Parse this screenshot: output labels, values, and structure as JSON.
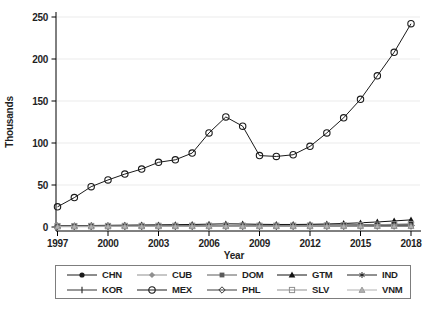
{
  "chart_data": {
    "type": "line",
    "title": "",
    "xlabel": "Year",
    "ylabel": "Thousands",
    "units": "Thousands",
    "x": [
      1997,
      1998,
      1999,
      2000,
      2001,
      2002,
      2003,
      2004,
      2005,
      2006,
      2007,
      2008,
      2009,
      2010,
      2011,
      2012,
      2013,
      2014,
      2015,
      2016,
      2017,
      2018
    ],
    "xticks": [
      1997,
      2000,
      2003,
      2006,
      2009,
      2012,
      2015,
      2018
    ],
    "yticks": [
      0,
      50,
      100,
      150,
      200,
      250
    ],
    "ylim": [
      0,
      250
    ],
    "xlim": [
      1997,
      2018
    ],
    "grid": "horizontal",
    "gridline_color": "#ebebeb",
    "axis_color": "#000000",
    "legend_position": "bottom",
    "legend_columns": 5,
    "series": [
      {
        "name": "CHN",
        "marker": "circle_f",
        "color": "#1a1a1a",
        "values": [
          1.2,
          1.3,
          1.3,
          1.4,
          1.5,
          1.5,
          1.6,
          1.6,
          1.7,
          1.8,
          1.8,
          1.9,
          2.0,
          2.0,
          2.1,
          2.2,
          2.3,
          2.4,
          2.6,
          2.8,
          3.0,
          3.2
        ]
      },
      {
        "name": "CUB",
        "marker": "diamond_f",
        "color": "#8f8f8f",
        "values": [
          0.9,
          0.9,
          0.9,
          1.0,
          1.0,
          1.0,
          1.0,
          1.1,
          1.1,
          1.1,
          1.1,
          1.1,
          1.0,
          1.0,
          1.1,
          1.1,
          1.2,
          1.2,
          1.3,
          1.3,
          1.4,
          1.5
        ]
      },
      {
        "name": "DOM",
        "marker": "square_f",
        "color": "#5a5a5a",
        "values": [
          0.7,
          0.7,
          0.7,
          0.8,
          0.8,
          0.8,
          0.8,
          0.8,
          0.9,
          0.9,
          0.9,
          0.9,
          0.8,
          0.8,
          0.9,
          0.9,
          0.9,
          1.0,
          1.0,
          1.1,
          1.1,
          1.2
        ]
      },
      {
        "name": "GTM",
        "marker": "triangle_f",
        "color": "#111111",
        "values": [
          1.5,
          1.6,
          1.8,
          2.0,
          2.2,
          2.4,
          2.6,
          2.8,
          3.0,
          3.4,
          3.8,
          3.6,
          3.2,
          3.0,
          3.0,
          3.2,
          3.6,
          4.2,
          5.0,
          6.0,
          7.2,
          8.5
        ]
      },
      {
        "name": "IND",
        "marker": "asterisk",
        "color": "#222222",
        "values": [
          0.5,
          0.5,
          0.5,
          0.6,
          0.6,
          0.6,
          0.6,
          0.6,
          0.7,
          0.7,
          0.7,
          0.7,
          0.7,
          0.7,
          0.7,
          0.8,
          0.8,
          0.8,
          0.9,
          0.9,
          1.0,
          1.0
        ]
      },
      {
        "name": "KOR",
        "marker": "vbar",
        "color": "#333333",
        "values": [
          0.6,
          0.6,
          0.7,
          0.7,
          0.7,
          0.7,
          0.8,
          0.8,
          0.8,
          0.8,
          0.8,
          0.8,
          0.8,
          0.8,
          0.8,
          0.9,
          0.9,
          0.9,
          1.0,
          1.0,
          1.0,
          1.1
        ]
      },
      {
        "name": "MEX",
        "marker": "circle_o",
        "color": "#1a1a1a",
        "values": [
          24,
          35,
          48,
          56,
          63,
          69,
          77,
          80,
          88,
          112,
          131,
          120,
          85,
          84,
          86,
          96,
          112,
          130,
          152,
          180,
          208,
          242
        ]
      },
      {
        "name": "PHL",
        "marker": "diamond_o",
        "color": "#3a3a3a",
        "values": [
          1.0,
          1.0,
          1.1,
          1.1,
          1.2,
          1.2,
          1.2,
          1.3,
          1.3,
          1.3,
          1.4,
          1.4,
          1.3,
          1.3,
          1.4,
          1.4,
          1.5,
          1.5,
          1.6,
          1.7,
          1.8,
          1.9
        ]
      },
      {
        "name": "SLV",
        "marker": "square_o",
        "color": "#8f8f8f",
        "values": [
          1.1,
          1.1,
          1.2,
          1.2,
          1.3,
          1.3,
          1.4,
          1.4,
          1.5,
          1.6,
          1.7,
          1.6,
          1.5,
          1.5,
          1.6,
          1.7,
          1.9,
          2.1,
          2.4,
          2.8,
          3.2,
          3.6
        ]
      },
      {
        "name": "VNM",
        "marker": "triangle_lf",
        "color": "#b0b0b0",
        "values": [
          0.6,
          0.6,
          0.6,
          0.7,
          0.7,
          0.7,
          0.7,
          0.7,
          0.8,
          0.8,
          0.8,
          0.8,
          0.8,
          0.8,
          0.8,
          0.8,
          0.9,
          0.9,
          0.9,
          1.0,
          1.0,
          1.0
        ]
      }
    ]
  }
}
